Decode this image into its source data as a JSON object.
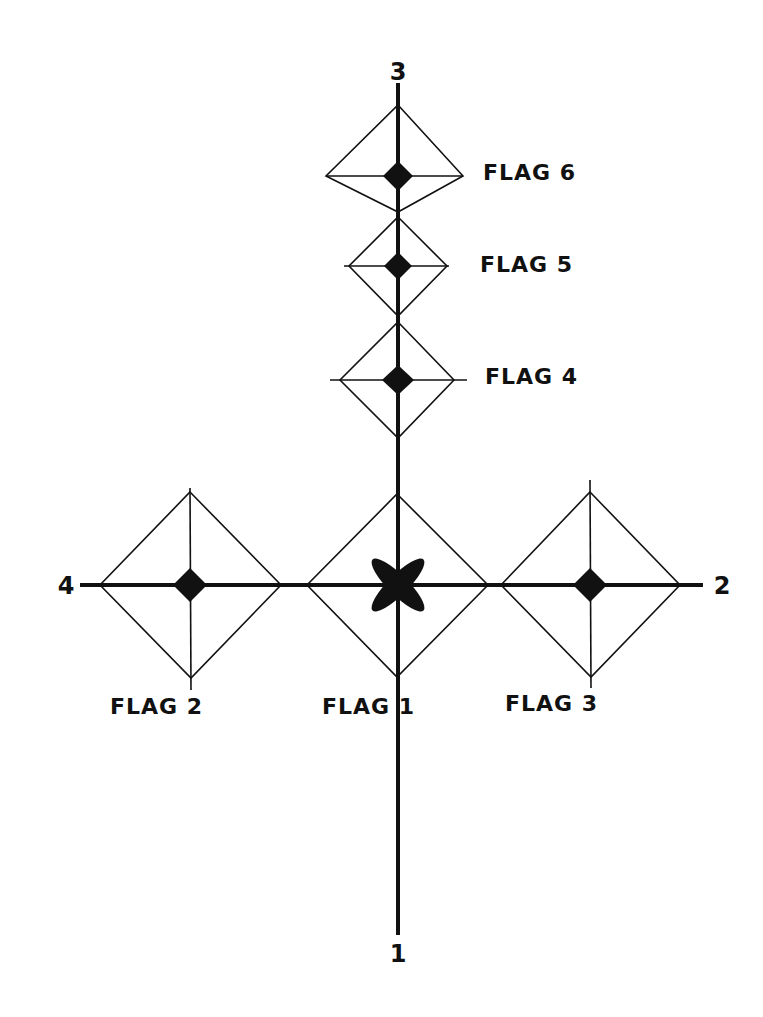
{
  "diagram": {
    "colors": {
      "ink": "#111111",
      "background": "#ffffff"
    },
    "axis_labels": {
      "top": "3",
      "right": "2",
      "bottom": "1",
      "left": "4"
    },
    "flags": [
      {
        "id": 1,
        "label": "FLAG 1",
        "marker": "x-star-icon"
      },
      {
        "id": 2,
        "label": "FLAG 2",
        "marker": "filled-diamond-icon"
      },
      {
        "id": 3,
        "label": "FLAG 3",
        "marker": "filled-diamond-icon"
      },
      {
        "id": 4,
        "label": "FLAG 4",
        "marker": "filled-diamond-icon"
      },
      {
        "id": 5,
        "label": "FLAG 5",
        "marker": "filled-diamond-icon"
      },
      {
        "id": 6,
        "label": "FLAG 6",
        "marker": "filled-diamond-icon"
      }
    ]
  }
}
